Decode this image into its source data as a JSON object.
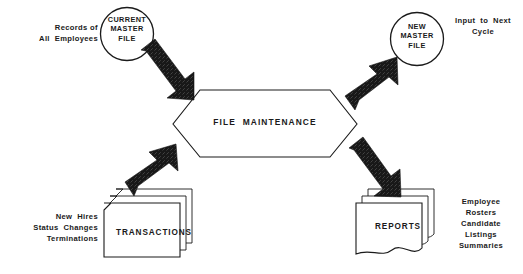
{
  "diagram": {
    "nodes": {
      "current_master_file": {
        "label": "CURRENT\nMASTER\nFILE",
        "shape": "circle",
        "semantic": "magnetic-tape-master-file"
      },
      "new_master_file": {
        "label": "NEW\nMASTER\nFILE",
        "shape": "circle",
        "semantic": "magnetic-tape-master-file"
      },
      "file_maintenance": {
        "label": "FILE  MAINTENANCE",
        "shape": "hexagon",
        "semantic": "process"
      },
      "transactions": {
        "label": "TRANSACTIONS",
        "shape": "document-stack",
        "semantic": "input-documents"
      },
      "reports": {
        "label": "REPORTS",
        "shape": "document-stack-wavy",
        "semantic": "output-documents"
      }
    },
    "annotations": {
      "records_of_all_employees": "Records of\nAll  Employees",
      "input_to_next_cycle": "Input  to  Next\nCycle",
      "transaction_types": "New  Hires\nStatus  Changes\nTerminations",
      "report_types": "Employee\nRosters\nCandidate\nListings\nSummaries"
    },
    "arrows": [
      {
        "name": "arrow-current-master-to-process",
        "from": "current_master_file",
        "to": "file_maintenance",
        "direction": "down-right"
      },
      {
        "name": "arrow-transactions-to-process",
        "from": "transactions",
        "to": "file_maintenance",
        "direction": "up-right"
      },
      {
        "name": "arrow-process-to-new-master",
        "from": "file_maintenance",
        "to": "new_master_file",
        "direction": "up-right"
      },
      {
        "name": "arrow-process-to-reports",
        "from": "file_maintenance",
        "to": "reports",
        "direction": "down-right"
      }
    ],
    "colors": {
      "stroke": "#1a1a1a",
      "fill": "#ffffff",
      "arrow": "#181818",
      "background": "#ffffff"
    }
  }
}
